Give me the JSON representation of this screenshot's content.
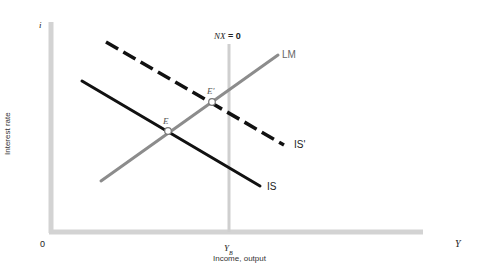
{
  "diagram": {
    "axes": {
      "y_symbol": "i",
      "y_label": "Interest rate",
      "x_symbol": "Y",
      "x_label": "Income, output",
      "origin": "0",
      "color": "#d0d0d0"
    },
    "nx_line": {
      "label": "NX = 0",
      "label_italic": "NX",
      "label_rest": " = 0",
      "tick_label": "Y",
      "tick_sub": "B",
      "color": "#cfcfcf"
    },
    "curves": [
      {
        "name": "LM",
        "label": "LM",
        "style": "solid",
        "color": "#8c8c8c"
      },
      {
        "name": "IS",
        "label": "IS",
        "style": "solid",
        "color": "#111111"
      },
      {
        "name": "IS'",
        "label": "IS'",
        "style": "dashed",
        "color": "#111111"
      }
    ],
    "points": [
      {
        "name": "E",
        "label": "E"
      },
      {
        "name": "E'",
        "label": "E'"
      }
    ]
  }
}
